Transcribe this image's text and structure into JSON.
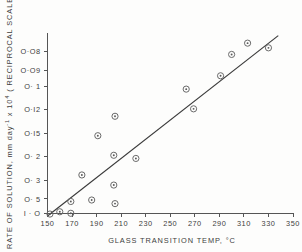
{
  "chart_data": {
    "type": "scatter",
    "title": "",
    "xlabel": "GLASS  TRANSITION  TEMP,  °C",
    "ylabel_parts": {
      "main": "RATE  OF  SOLUTION, mm  day",
      "sup1": "-1",
      "mid": " x  10",
      "sup2": "4",
      "tail": " ( RECIPROCAL  SCALE"
    },
    "ylabel": "RATE OF SOLUTION, mm day-1 x 10^4 ( RECIPROCAL SCALE",
    "xlim": [
      150,
      350
    ],
    "xticks": [
      150,
      170,
      190,
      210,
      230,
      250,
      270,
      290,
      310,
      330,
      350
    ],
    "xtick_labels": [
      "150",
      "170",
      "190",
      "210",
      "230",
      "250",
      "270",
      "290",
      "310",
      "330",
      "350"
    ],
    "y_scale": "reciprocal",
    "yticks": [
      0.08,
      0.09,
      0.1,
      0.12,
      0.15,
      0.2,
      0.3,
      0.5,
      1.0
    ],
    "ytick_labels": [
      "O·O8",
      "O·O9",
      "O· 1",
      "O·I2",
      "O·I5",
      "O· 2",
      "O· 3",
      "O· 5",
      "I · O"
    ],
    "ylim_reciprocal": [
      1.0,
      0.0725
    ],
    "grid": false,
    "legend": null,
    "marker_style": "open-circle-with-center-dot",
    "points": [
      {
        "x": 152,
        "y": 1.08
      },
      {
        "x": 160,
        "y": 0.92
      },
      {
        "x": 169,
        "y": 1.02
      },
      {
        "x": 169,
        "y": 0.55
      },
      {
        "x": 178,
        "y": 0.27
      },
      {
        "x": 186,
        "y": 0.52
      },
      {
        "x": 191,
        "y": 0.154
      },
      {
        "x": 205,
        "y": 0.127
      },
      {
        "x": 204,
        "y": 0.196
      },
      {
        "x": 204,
        "y": 0.335
      },
      {
        "x": 205,
        "y": 0.6
      },
      {
        "x": 222,
        "y": 0.205
      },
      {
        "x": 263,
        "y": 0.102
      },
      {
        "x": 269,
        "y": 0.119
      },
      {
        "x": 291,
        "y": 0.093
      },
      {
        "x": 300,
        "y": 0.0815
      },
      {
        "x": 313,
        "y": 0.0765
      },
      {
        "x": 330,
        "y": 0.0785
      }
    ],
    "fit_line": {
      "description": "straight line fitted through points on reciprocal y-scale",
      "x_start": 150,
      "y_start": 1.28,
      "x_end": 338,
      "y_end": 0.0735
    }
  }
}
